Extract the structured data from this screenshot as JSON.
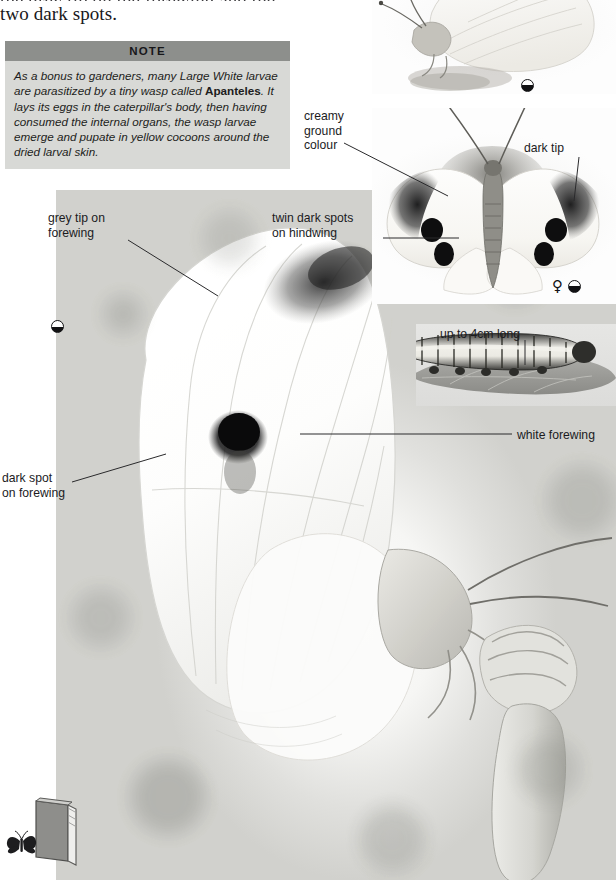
{
  "page": {
    "width": 616,
    "height": 880,
    "background": "#ffffff"
  },
  "body_copy": {
    "clipped_line": "the grey tip on the forewing and the",
    "visible_line": "two dark spots."
  },
  "note": {
    "heading": "NOTE",
    "text_part1": "As a bonus to gardeners, many Large White larvae are parasitized by a tiny wasp called ",
    "species_name": "Apanteles",
    "text_part2": ". It lays its eggs in the caterpillar's body, then having consumed the internal organs, the wasp larvae emerge and pupate in yellow cocoons around the dried larval skin.",
    "header_bg": "#8d8f8c",
    "body_bg": "#d8d9d6"
  },
  "labels": {
    "creamy_ground_colour": "creamy\nground\ncolour",
    "dark_tip": "dark tip",
    "grey_tip_on_forewing": "grey tip on\nforewing",
    "twin_dark_spots_on_hindwing": "twin dark spots\non hindwing",
    "up_to_4cm_long": "up to 4cm long",
    "white_forewing": "white forewing",
    "dark_spot_on_forewing": "dark spot\non forewing"
  },
  "symbols": {
    "half_life_size": "half-life-size-icon",
    "female": "♀",
    "female_name": "female-symbol-icon",
    "book": "book-icon",
    "butterfly_mark": "butterfly-icon"
  },
  "colors": {
    "ink": "#1b1b1e",
    "note_header": "#8d8f8c",
    "note_body": "#d8d9d6",
    "leader_line": "#2a2a2c",
    "photo_mid": "#c4c4bf"
  }
}
